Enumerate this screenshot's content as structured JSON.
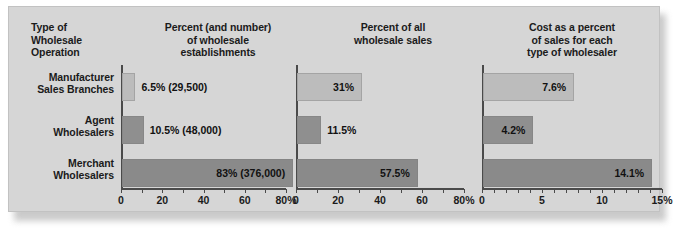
{
  "figure": {
    "background_color": "#d6d6d6",
    "row_label_header": "Type of\nWholesale\nOperation",
    "headers": {
      "type_col": "Type of Wholesale Operation",
      "type_col_line1": "Type of",
      "type_col_line2": "Wholesale",
      "type_col_line3": "Operation",
      "col1_line1": "Percent (and number)",
      "col1_line2": "of wholesale",
      "col1_line3": "establishments",
      "col2_line1": "Percent of all",
      "col2_line2": "wholesale sales",
      "col3_line1": "Cost as a percent",
      "col3_line2": "of sales for each",
      "col3_line3": "type of wholesaler"
    },
    "row_labels": [
      {
        "line1": "Manufacturer",
        "line2": "Sales Branches"
      },
      {
        "line1": "Agent",
        "line2": "Wholesalers"
      },
      {
        "line1": "Merchant",
        "line2": "Wholesalers"
      }
    ]
  },
  "chart_data": [
    {
      "type": "bar",
      "orientation": "horizontal",
      "title": "Percent (and number) of wholesale establishments",
      "xlabel": "",
      "ylabel": "",
      "xlim": [
        0,
        80
      ],
      "xticks": [
        0,
        10,
        20,
        30,
        40,
        50,
        60,
        70,
        80
      ],
      "xticklabels": [
        "0",
        "",
        "20",
        "",
        "40",
        "",
        "60",
        "",
        "80%"
      ],
      "grid": false,
      "legend": "none",
      "categories": [
        "Manufacturer Sales Branches",
        "Agent Wholesalers",
        "Merchant Wholesalers"
      ],
      "values": [
        6.5,
        10.5,
        83
      ],
      "data_labels": [
        "6.5% (29,500)",
        "10.5% (48,000)",
        "83% (376,000)"
      ],
      "label_placement": [
        "outside",
        "outside",
        "inside"
      ],
      "bar_colors": [
        "#bcbcbc",
        "#8f8f8f",
        "#8a8a8a"
      ]
    },
    {
      "type": "bar",
      "orientation": "horizontal",
      "title": "Percent of all wholesale sales",
      "xlabel": "",
      "ylabel": "",
      "xlim": [
        0,
        80
      ],
      "xticks": [
        0,
        10,
        20,
        30,
        40,
        50,
        60,
        70,
        80
      ],
      "xticklabels": [
        "0",
        "",
        "20",
        "",
        "40",
        "",
        "60",
        "",
        "80%"
      ],
      "grid": false,
      "legend": "none",
      "categories": [
        "Manufacturer Sales Branches",
        "Agent Wholesalers",
        "Merchant Wholesalers"
      ],
      "values": [
        31,
        11.5,
        57.5
      ],
      "data_labels": [
        "31%",
        "11.5%",
        "57.5%"
      ],
      "label_placement": [
        "inside",
        "outside",
        "inside"
      ],
      "bar_colors": [
        "#bcbcbc",
        "#8f8f8f",
        "#8a8a8a"
      ]
    },
    {
      "type": "bar",
      "orientation": "horizontal",
      "title": "Cost as a percent of sales for each type of wholesaler",
      "xlabel": "",
      "ylabel": "",
      "xlim": [
        0,
        15
      ],
      "xticks": [
        0,
        1,
        2,
        3,
        4,
        5,
        6,
        7,
        8,
        9,
        10,
        11,
        12,
        13,
        14,
        15
      ],
      "xticklabels": [
        "0",
        "",
        "",
        "",
        "",
        "5",
        "",
        "",
        "",
        "",
        "10",
        "",
        "",
        "",
        "",
        "15%"
      ],
      "grid": false,
      "legend": "none",
      "categories": [
        "Manufacturer Sales Branches",
        "Agent Wholesalers",
        "Merchant Wholesalers"
      ],
      "values": [
        7.6,
        4.2,
        14.1
      ],
      "data_labels": [
        "7.6%",
        "4.2%",
        "14.1%"
      ],
      "label_placement": [
        "inside",
        "inside",
        "inside"
      ],
      "bar_colors": [
        "#bcbcbc",
        "#8f8f8f",
        "#8a8a8a"
      ]
    }
  ]
}
